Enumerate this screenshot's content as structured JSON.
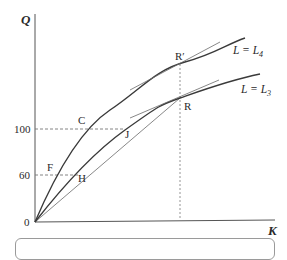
{
  "diagram": {
    "axes": {
      "y_label": "Q",
      "x_label": "K",
      "origin_label": "0",
      "y_ticks": [
        "100",
        "60"
      ]
    },
    "points": {
      "C": "C",
      "J": "J",
      "F": "F",
      "H": "H",
      "R": "R",
      "R_prime": "R′"
    },
    "curves": [
      {
        "name": "upper",
        "label": "L = L",
        "subscript": "4"
      },
      {
        "name": "lower",
        "label": "L = L",
        "subscript": "3"
      }
    ],
    "colors": {
      "curve": "#3a3a3a",
      "axis": "#555555",
      "tangent": "#6a6a6a",
      "guide": "#777777"
    }
  }
}
